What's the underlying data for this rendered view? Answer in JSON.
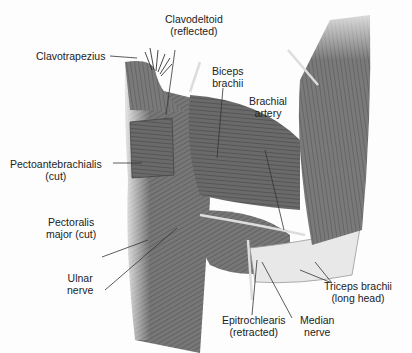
{
  "figure": {
    "labels": [
      {
        "id": "clavodeltoid",
        "lines": [
          "Clavodeltoid",
          "(reflected)"
        ]
      },
      {
        "id": "clavotrapezius",
        "lines": [
          "Clavotrapezius"
        ]
      },
      {
        "id": "biceps",
        "lines": [
          "Biceps",
          "brachii"
        ]
      },
      {
        "id": "brachial-artery",
        "lines": [
          "Brachial",
          "artery"
        ]
      },
      {
        "id": "pectoantebrachialis",
        "lines": [
          "Pectoantebrachialis",
          "(cut)"
        ]
      },
      {
        "id": "pectoralis-major",
        "lines": [
          "Pectoralis",
          "major (cut)"
        ]
      },
      {
        "id": "ulnar-nerve",
        "lines": [
          "Ulnar",
          "nerve"
        ]
      },
      {
        "id": "triceps",
        "lines": [
          "Triceps brachii",
          "(long head)"
        ]
      },
      {
        "id": "epitrochlearis",
        "lines": [
          "Epitrochlearis",
          "(retracted)"
        ]
      },
      {
        "id": "median-nerve",
        "lines": [
          "Median",
          "nerve"
        ]
      }
    ]
  }
}
